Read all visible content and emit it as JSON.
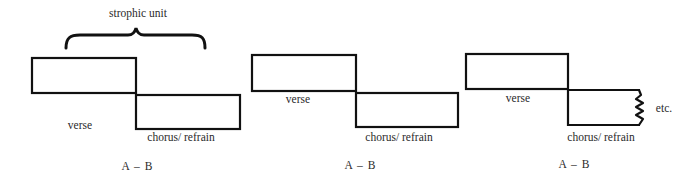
{
  "diagram": {
    "brace_label": "strophic unit",
    "panels": [
      {
        "verse": {
          "label": "verse",
          "x": 32,
          "y": 58,
          "w": 104,
          "h": 35,
          "label_x": 80,
          "label_y": 120
        },
        "chorus": {
          "label": "chorus/ refrain",
          "x": 136,
          "y": 95,
          "w": 104,
          "h": 34,
          "label_x": 180,
          "label_y": 132
        },
        "form": "A  –  B",
        "form_x": 137,
        "form_y": 161,
        "brace": {
          "x1": 65,
          "x2": 205,
          "y": 30
        }
      },
      {
        "verse": {
          "label": "verse",
          "x": 252,
          "y": 55,
          "w": 104,
          "h": 36,
          "label_x": 298,
          "label_y": 94
        },
        "chorus": {
          "label": "chorus/ refrain",
          "x": 356,
          "y": 93,
          "w": 102,
          "h": 34,
          "label_x": 399,
          "label_y": 132
        },
        "form": "A  –  B",
        "form_x": 360,
        "form_y": 161
      },
      {
        "verse": {
          "label": "verse",
          "x": 466,
          "y": 54,
          "w": 102,
          "h": 35,
          "label_x": 518,
          "label_y": 93
        },
        "chorus": {
          "label": "chorus/ refrain",
          "x": 568,
          "y": 90,
          "w": 72,
          "h": 35,
          "label_x": 601,
          "label_y": 132,
          "open_end": "zigzag"
        },
        "continuation": "etc.",
        "continuation_x": 664,
        "continuation_y": 104,
        "form": "A  –  B",
        "form_x": 574,
        "form_y": 159
      }
    ],
    "stroke_color": "#111111"
  }
}
